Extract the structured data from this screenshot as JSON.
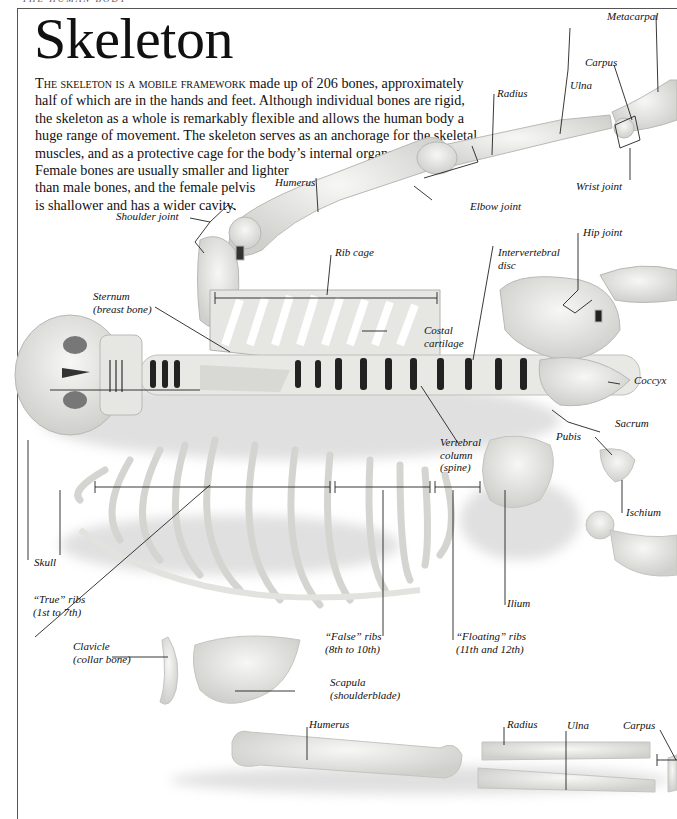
{
  "running_header": "THE HUMAN BODY",
  "title": "Skeleton",
  "intro": {
    "lead": "The skeleton is a mobile framework",
    "lines": [
      " made up of 206 bones, approximately",
      "half of which are in the hands and feet. Although individual bones are rigid,",
      "the skeleton as a whole is remarkably flexible and allows the human body a",
      "huge range of movement. The skeleton serves as an anchorage for the skeletal",
      "muscles, and as a protective cage for the body’s internal organs.",
      "Female bones are usually smaller and lighter",
      "than male bones, and the female pelvis",
      "is shallower and has a wider cavity."
    ]
  },
  "labels": {
    "metacarpal": "Metacarpal",
    "carpus_top": "Carpus",
    "ulna_top": "Ulna",
    "radius_top": "Radius",
    "wrist_joint": "Wrist joint",
    "elbow_joint": "Elbow joint",
    "humerus_top": "Humerus",
    "shoulder_joint": "Shoulder joint",
    "rib_cage": "Rib cage",
    "intervertebral_disc": [
      "Intervertebral",
      "disc"
    ],
    "hip_joint": "Hip joint",
    "sternum": [
      "Sternum",
      "(breast bone)"
    ],
    "costal_cartilage": [
      "Costal",
      "cartilage"
    ],
    "coccyx": "Coccyx",
    "sacrum": "Sacrum",
    "vertebral_column": [
      "Vertebral",
      "column",
      "(spine)"
    ],
    "pubis": "Pubis",
    "ischium": "Ischium",
    "skull": "Skull",
    "true_ribs": [
      "“True” ribs",
      "(1st to 7th)"
    ],
    "ilium": "Ilium",
    "false_ribs": [
      "“False” ribs",
      "(8th to 10th)"
    ],
    "floating_ribs": [
      "“Floating” ribs",
      "(11th and 12th)"
    ],
    "clavicle": [
      "Clavicle",
      "(collar bone)"
    ],
    "scapula": [
      "Scapula",
      "(shoulderblade)"
    ],
    "humerus_bottom": "Humerus",
    "radius_bottom": "Radius",
    "ulna_bottom": "Ulna",
    "carpus_bottom": "Carpus"
  }
}
